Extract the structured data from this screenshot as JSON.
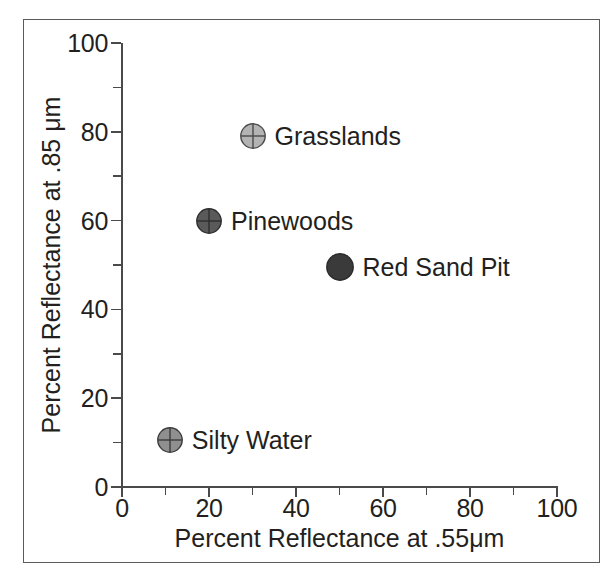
{
  "figure": {
    "background": "#ffffff",
    "frame_color": "#5b5b5b",
    "axis_color": "#4a4a4a",
    "text_color": "#231f20"
  },
  "chart_data": {
    "type": "scatter",
    "title": "",
    "xlabel": "Percent Reflectance at .55μm",
    "ylabel": "Percent Reflectance at .85 μm",
    "xlim": [
      0,
      100
    ],
    "ylim": [
      0,
      100
    ],
    "grid": false,
    "legend": "none (points labeled inline)",
    "x_ticks_major": [
      0,
      20,
      40,
      60,
      80,
      100
    ],
    "x_ticks_minor": [
      10,
      30,
      50,
      70,
      90
    ],
    "y_ticks_major": [
      0,
      20,
      40,
      60,
      80,
      100
    ],
    "y_ticks_minor": [
      10,
      30,
      50,
      70,
      90
    ],
    "x_tick_labels": [
      "0",
      "20",
      "40",
      "60",
      "80",
      "100"
    ],
    "y_tick_labels": [
      "0",
      "20",
      "40",
      "60",
      "80",
      "100"
    ],
    "points": [
      {
        "label": "Grasslands",
        "x": 30,
        "y": 79,
        "marker": "circle-crosshair",
        "fill": "#b3b3b3",
        "stroke": "#4a4a4a",
        "radius": 13
      },
      {
        "label": "Pinewoods",
        "x": 20,
        "y": 60,
        "marker": "circle-crosshair",
        "fill": "#5a5a5a",
        "stroke": "#2e2e2e",
        "radius": 13
      },
      {
        "label": "Red Sand Pit",
        "x": 50,
        "y": 49.5,
        "marker": "circle-solid",
        "fill": "#3a3a3a",
        "stroke": "#2a2a2a",
        "radius": 14
      },
      {
        "label": "Silty Water",
        "x": 11,
        "y": 10.5,
        "marker": "circle-crosshair",
        "fill": "#8f8f8f",
        "stroke": "#3c3c3c",
        "radius": 13
      }
    ]
  }
}
